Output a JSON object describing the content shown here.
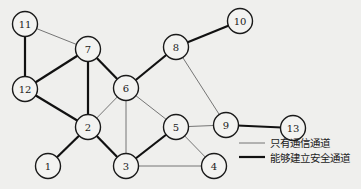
{
  "diagram": {
    "type": "network-graph",
    "nodes": [
      {
        "id": "1",
        "label": "1"
      },
      {
        "id": "2",
        "label": "2"
      },
      {
        "id": "3",
        "label": "3"
      },
      {
        "id": "4",
        "label": "4"
      },
      {
        "id": "5",
        "label": "5"
      },
      {
        "id": "6",
        "label": "6"
      },
      {
        "id": "7",
        "label": "7"
      },
      {
        "id": "8",
        "label": "8"
      },
      {
        "id": "9",
        "label": "9"
      },
      {
        "id": "10",
        "label": "10"
      },
      {
        "id": "11",
        "label": "11"
      },
      {
        "id": "12",
        "label": "12"
      },
      {
        "id": "13",
        "label": "13"
      }
    ],
    "edges": [
      {
        "from": "11",
        "to": "12",
        "kind": "secure"
      },
      {
        "from": "12",
        "to": "7",
        "kind": "secure"
      },
      {
        "from": "7",
        "to": "2",
        "kind": "secure"
      },
      {
        "from": "7",
        "to": "6",
        "kind": "secure"
      },
      {
        "from": "6",
        "to": "8",
        "kind": "secure"
      },
      {
        "from": "8",
        "to": "10",
        "kind": "secure"
      },
      {
        "from": "12",
        "to": "2",
        "kind": "secure"
      },
      {
        "from": "2",
        "to": "1",
        "kind": "secure"
      },
      {
        "from": "2",
        "to": "3",
        "kind": "secure"
      },
      {
        "from": "3",
        "to": "5",
        "kind": "secure"
      },
      {
        "from": "9",
        "to": "13",
        "kind": "secure"
      },
      {
        "from": "11",
        "to": "7",
        "kind": "comm"
      },
      {
        "from": "6",
        "to": "2",
        "kind": "comm"
      },
      {
        "from": "6",
        "to": "3",
        "kind": "comm"
      },
      {
        "from": "6",
        "to": "5",
        "kind": "comm"
      },
      {
        "from": "8",
        "to": "9",
        "kind": "comm"
      },
      {
        "from": "9",
        "to": "5",
        "kind": "comm"
      },
      {
        "from": "5",
        "to": "4",
        "kind": "comm"
      },
      {
        "from": "3",
        "to": "4",
        "kind": "comm"
      }
    ],
    "legend": {
      "comm_label": "只有通信通道",
      "secure_label": "能够建立安全通道"
    }
  }
}
